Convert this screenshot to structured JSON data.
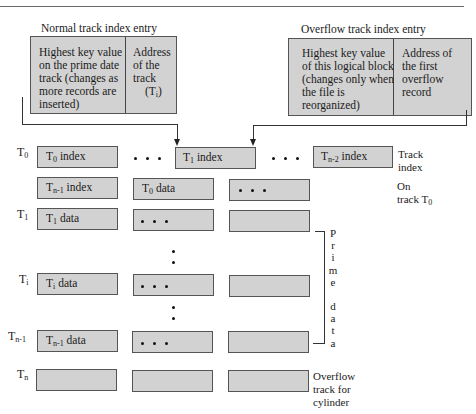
{
  "normal_entry": {
    "title": "Normal track index entry",
    "left_cell": "Highest key value on the prime date track (changes as more records are inserted)",
    "right_cell_lines": [
      "Address",
      "of the",
      "track"
    ],
    "right_cell_sym": "(T",
    "right_cell_sub": "i",
    "right_cell_close": ")"
  },
  "overflow_entry": {
    "title": "Overflow track index entry",
    "left_cell": "Highest key value of this logical block (changes only when the file is reorganized)",
    "right_cell": "Address of the first overflow record"
  },
  "rows": [
    {
      "label": "T",
      "sub": "0"
    },
    {
      "label": "T",
      "sub": "1"
    },
    {
      "label": "T",
      "sub": "i"
    },
    {
      "label": "T",
      "sub": "n-1"
    },
    {
      "label": "T",
      "sub": "n"
    }
  ],
  "boxes": {
    "t0_index": {
      "t": "T",
      "sub": "0",
      "rest": " index"
    },
    "t1_index": {
      "t": "T",
      "sub": "1",
      "rest": " index"
    },
    "tn2_index": {
      "t": "T",
      "sub": "n-2",
      "rest": " index"
    },
    "tn1_index": {
      "t": "T",
      "sub": "n-1",
      "rest": " index"
    },
    "t0_data": {
      "t": "T",
      "sub": "0",
      "rest": " data"
    },
    "t1_data": {
      "t": "T",
      "sub": "1",
      "rest": " data"
    },
    "ti_data": {
      "t": "T",
      "sub": "i",
      "rest": " data"
    },
    "tn1_data": {
      "t": "T",
      "sub": "n-1",
      "rest": " data"
    }
  },
  "side_labels": {
    "track_index": [
      "Track",
      "index"
    ],
    "on_track": [
      "On",
      "track T"
    ],
    "on_track_sub": "0",
    "overflow_track": [
      "Overflow",
      "track for",
      "cylinder"
    ]
  },
  "prime_data_letters": [
    "P",
    "r",
    "i",
    "m",
    "e",
    "",
    "d",
    "a",
    "t",
    "a"
  ]
}
